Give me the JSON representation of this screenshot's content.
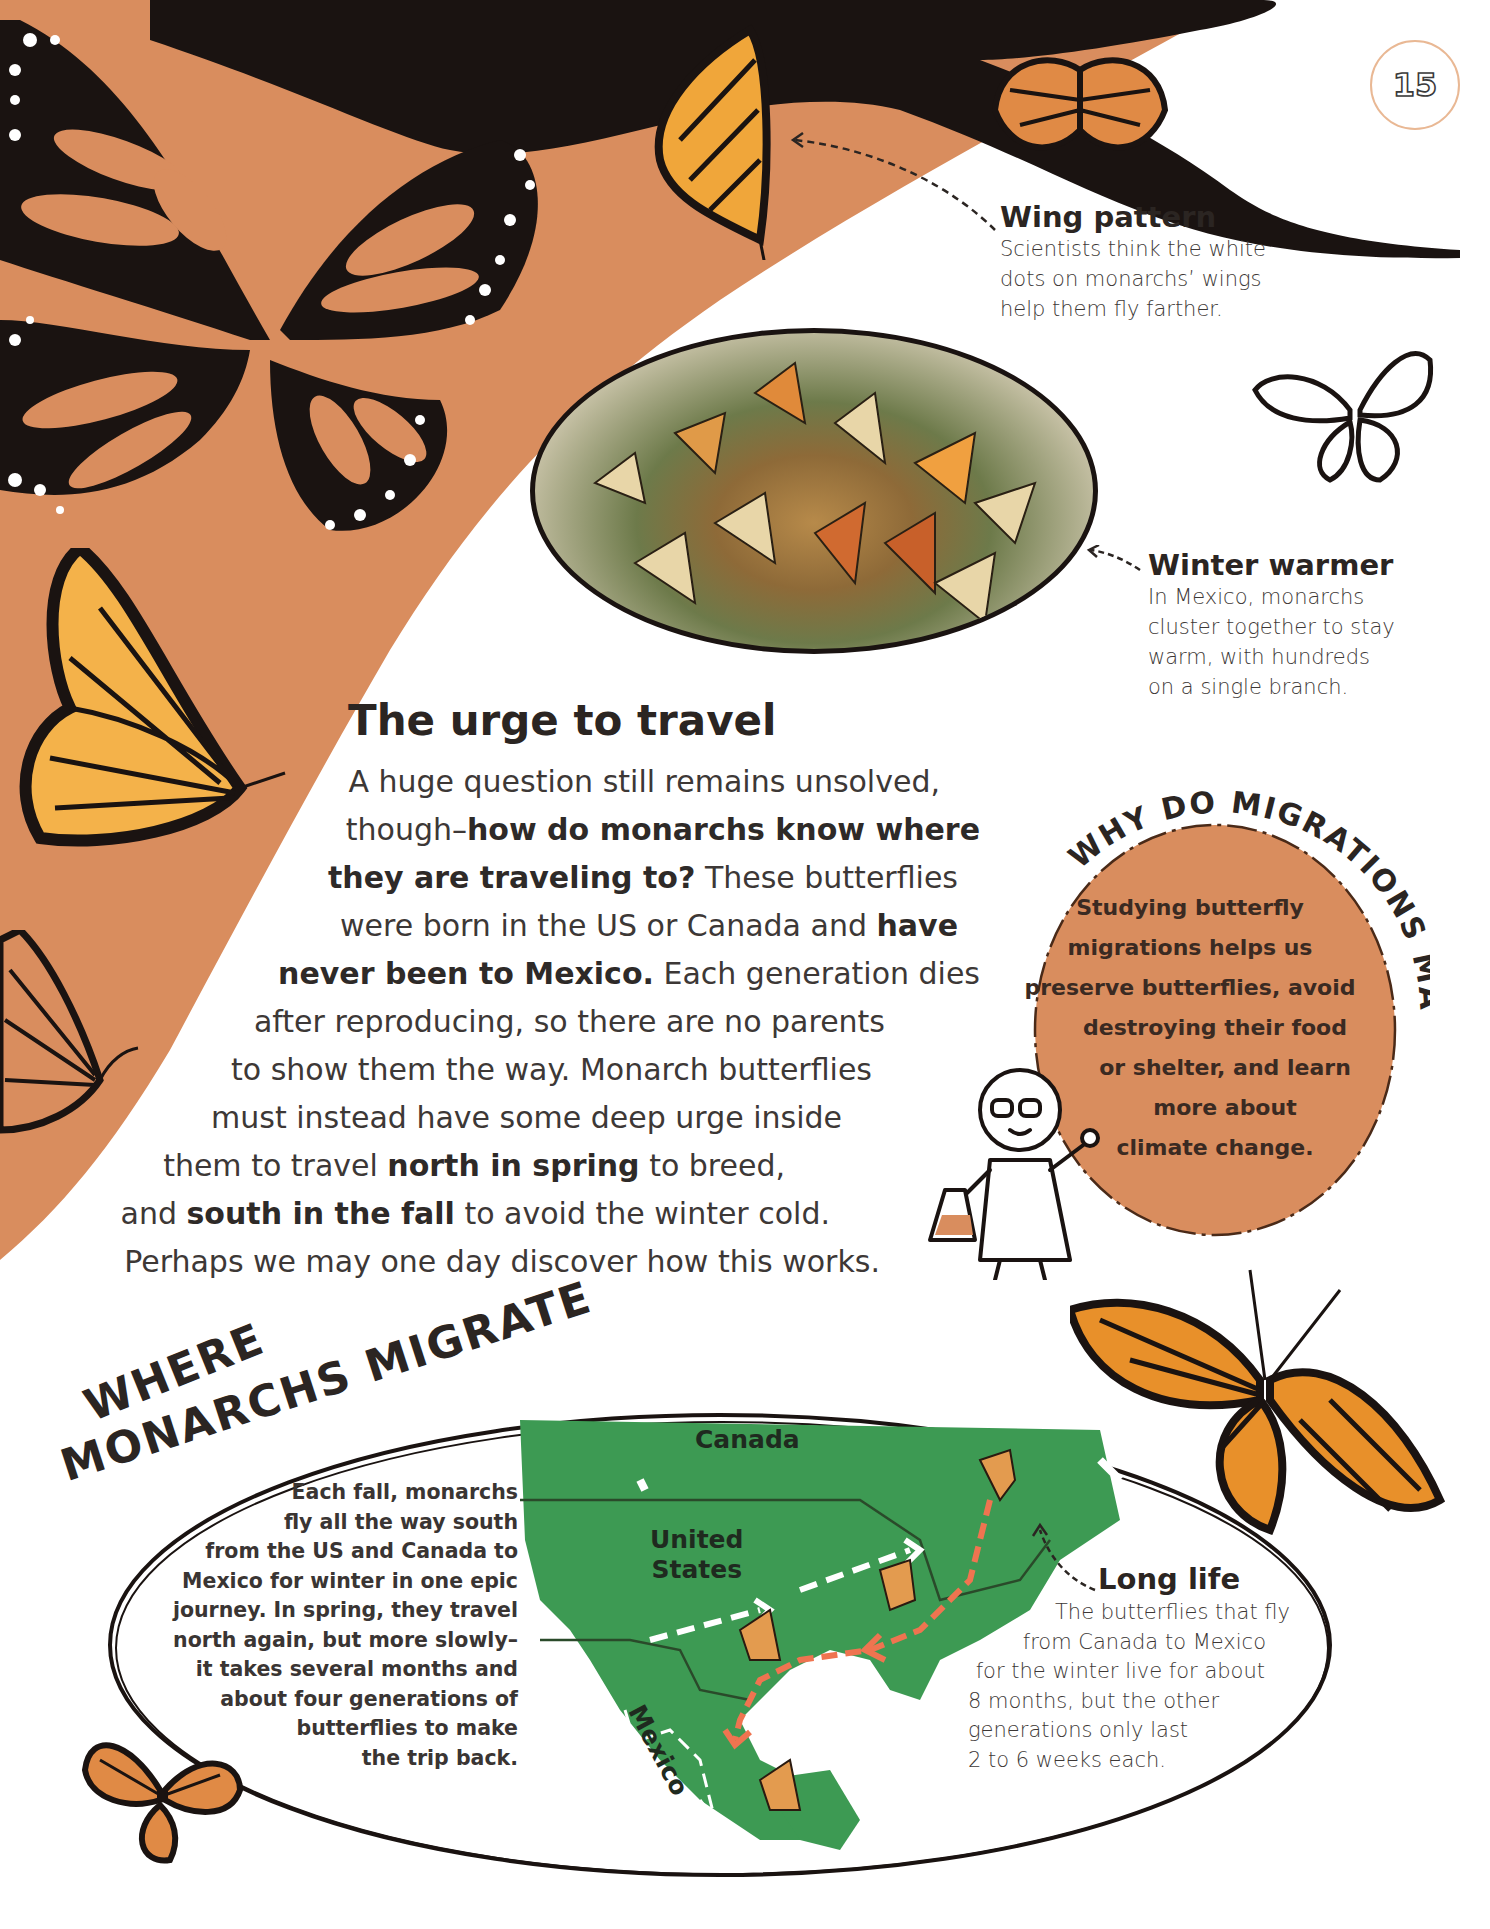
{
  "page": {
    "number": "15",
    "colors": {
      "background_orange": "#d98d5e",
      "silhouette_black": "#1a1311",
      "map_green": "#3d9a53",
      "arrow_orange": "#ef7450",
      "text_dark": "#3d3836",
      "badge_ring": "#e9b894"
    }
  },
  "captions": {
    "wing_pattern": {
      "title": "Wing pattern",
      "lines": [
        "Scientists think the white",
        "dots on monarchs’ wings",
        "help them fly farther."
      ]
    },
    "winter_warmer": {
      "title": "Winter warmer",
      "lines": [
        "In Mexico, monarchs",
        "cluster together to stay",
        "warm, with hundreds",
        "on a single branch."
      ]
    },
    "long_life": {
      "title": "Long life",
      "lines": [
        "The butterflies that fly",
        "from Canada to Mexico",
        "for the winter live for about",
        "8 months, but the other",
        "generations only last",
        "2 to 6 weeks each."
      ]
    }
  },
  "urge": {
    "title": "The urge to travel",
    "lines": [
      {
        "pre": "A huge question still remains unsolved,",
        "bold": "",
        "post": ""
      },
      {
        "pre": "though–",
        "bold": "how do monarchs know where",
        "post": ""
      },
      {
        "pre": "",
        "bold": "they are traveling to?",
        "post": " These butterflies"
      },
      {
        "pre": "were born in the US or Canada and ",
        "bold": "have",
        "post": ""
      },
      {
        "pre": "",
        "bold": "never been to Mexico.",
        "post": " Each generation dies"
      },
      {
        "pre": "after reproducing, so there are no parents",
        "bold": "",
        "post": ""
      },
      {
        "pre": "to show them the way. Monarch butterflies",
        "bold": "",
        "post": ""
      },
      {
        "pre": "must instead have some deep urge inside",
        "bold": "",
        "post": ""
      },
      {
        "pre": "them to travel ",
        "bold": "north in spring",
        "post": " to breed,"
      },
      {
        "pre": "and ",
        "bold": "south in the fall",
        "post": " to avoid the winter cold."
      },
      {
        "pre": "Perhaps we may one day discover how this works.",
        "bold": "",
        "post": ""
      }
    ]
  },
  "why_box": {
    "heading": "WHY DO MIGRATIONS MATTER?",
    "lines": [
      "Studying butterfly",
      "migrations helps us",
      "preserve butterflies, avoid",
      "destroying their food",
      "or shelter, and learn",
      "more about",
      "climate change."
    ]
  },
  "map_section": {
    "title_line1": "WHERE",
    "title_line2": "MONARCHS MIGRATE",
    "description_lines": [
      "Each fall, monarchs",
      "fly all the way south",
      "from the US and Canada to",
      "Mexico for winter in one epic",
      "journey. In spring, they travel",
      "north again, but more slowly–",
      "it takes several months and",
      "about four generations of",
      "butterflies to make",
      "the trip back."
    ],
    "labels": {
      "canada": "Canada",
      "united_states_1": "United",
      "united_states_2": "States",
      "mexico": "Mexico"
    }
  }
}
